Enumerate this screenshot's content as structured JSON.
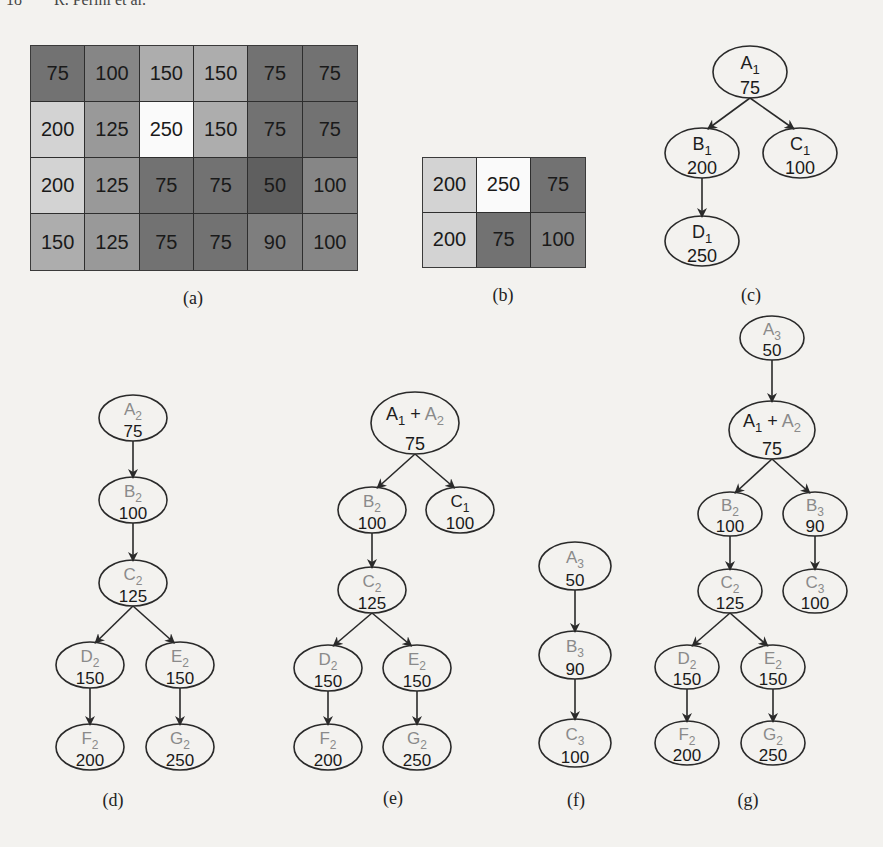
{
  "page": {
    "running_head": "18        R. Perini et al."
  },
  "colors": {
    "node_stroke": "#2a2a2a",
    "label_set1": "#1e1e1e",
    "label_set2": "#8a8a8a",
    "label_set3": "#8a8a8a",
    "value_text": "#1a1a1a"
  },
  "grid_a": {
    "caption": "(a)",
    "rows": [
      [
        75,
        100,
        150,
        "150",
        75,
        75
      ],
      [
        200,
        125,
        250,
        150,
        75,
        75
      ],
      [
        200,
        125,
        75,
        75,
        50,
        100
      ],
      [
        150,
        125,
        75,
        75,
        90,
        100
      ]
    ]
  },
  "grid_b": {
    "caption": "(b)",
    "rows": [
      [
        200,
        250,
        75
      ],
      [
        200,
        75,
        100
      ]
    ]
  },
  "trees": [
    {
      "id": "c",
      "caption": "(c)",
      "nodes": [
        {
          "id": "A1",
          "letter": "A",
          "sub": "1",
          "set": 1,
          "value": "75",
          "x": 750,
          "y": 72,
          "rx": 37,
          "ry": 26
        },
        {
          "id": "B1",
          "letter": "B",
          "sub": "1",
          "set": 1,
          "value": "200",
          "x": 702,
          "y": 153,
          "rx": 37,
          "ry": 25
        },
        {
          "id": "C1",
          "letter": "C",
          "sub": "1",
          "set": 1,
          "value": "100",
          "x": 800,
          "y": 153,
          "rx": 37,
          "ry": 25
        },
        {
          "id": "D1",
          "letter": "D",
          "sub": "1",
          "set": 1,
          "value": "250",
          "x": 702,
          "y": 241,
          "rx": 37,
          "ry": 25
        }
      ],
      "edges": [
        [
          "A1",
          "B1"
        ],
        [
          "A1",
          "C1"
        ],
        [
          "B1",
          "D1"
        ]
      ]
    },
    {
      "id": "d",
      "caption": "(d)",
      "nodes": [
        {
          "id": "A2",
          "letter": "A",
          "sub": "2",
          "set": 2,
          "value": "75",
          "x": 133,
          "y": 418,
          "rx": 34,
          "ry": 23
        },
        {
          "id": "B2",
          "letter": "B",
          "sub": "2",
          "set": 2,
          "value": "100",
          "x": 133,
          "y": 500,
          "rx": 34,
          "ry": 23
        },
        {
          "id": "C2",
          "letter": "C",
          "sub": "2",
          "set": 2,
          "value": "125",
          "x": 133,
          "y": 583,
          "rx": 34,
          "ry": 23
        },
        {
          "id": "D2",
          "letter": "D",
          "sub": "2",
          "set": 2,
          "value": "150",
          "x": 90,
          "y": 665,
          "rx": 34,
          "ry": 23
        },
        {
          "id": "E2",
          "letter": "E",
          "sub": "2",
          "set": 2,
          "value": "150",
          "x": 180,
          "y": 665,
          "rx": 34,
          "ry": 23
        },
        {
          "id": "F2",
          "letter": "F",
          "sub": "2",
          "set": 2,
          "value": "200",
          "x": 90,
          "y": 747,
          "rx": 34,
          "ry": 23
        },
        {
          "id": "G2",
          "letter": "G",
          "sub": "2",
          "set": 2,
          "value": "250",
          "x": 180,
          "y": 747,
          "rx": 34,
          "ry": 23
        }
      ],
      "edges": [
        [
          "A2",
          "B2"
        ],
        [
          "B2",
          "C2"
        ],
        [
          "C2",
          "D2"
        ],
        [
          "C2",
          "E2"
        ],
        [
          "D2",
          "F2"
        ],
        [
          "E2",
          "G2"
        ]
      ]
    },
    {
      "id": "e",
      "caption": "(e)",
      "nodes": [
        {
          "id": "A12",
          "letter": "A",
          "sub": "1",
          "set": 1,
          "plus_letter": "A",
          "plus_sub": "2",
          "plus_set": 2,
          "value": "75",
          "x": 415,
          "y": 423,
          "rx": 44,
          "ry": 31
        },
        {
          "id": "B2",
          "letter": "B",
          "sub": "2",
          "set": 2,
          "value": "100",
          "x": 372,
          "y": 510,
          "rx": 34,
          "ry": 23
        },
        {
          "id": "C1",
          "letter": "C",
          "sub": "1",
          "set": 1,
          "value": "100",
          "x": 460,
          "y": 510,
          "rx": 34,
          "ry": 23
        },
        {
          "id": "C2",
          "letter": "C",
          "sub": "2",
          "set": 2,
          "value": "125",
          "x": 372,
          "y": 590,
          "rx": 34,
          "ry": 23
        },
        {
          "id": "D2",
          "letter": "D",
          "sub": "2",
          "set": 2,
          "value": "150",
          "x": 328,
          "y": 668,
          "rx": 34,
          "ry": 23
        },
        {
          "id": "E2",
          "letter": "E",
          "sub": "2",
          "set": 2,
          "value": "150",
          "x": 417,
          "y": 668,
          "rx": 34,
          "ry": 23
        },
        {
          "id": "F2",
          "letter": "F",
          "sub": "2",
          "set": 2,
          "value": "200",
          "x": 328,
          "y": 747,
          "rx": 34,
          "ry": 23
        },
        {
          "id": "G2",
          "letter": "G",
          "sub": "2",
          "set": 2,
          "value": "250",
          "x": 417,
          "y": 747,
          "rx": 34,
          "ry": 23
        }
      ],
      "edges": [
        [
          "A12",
          "B2"
        ],
        [
          "A12",
          "C1"
        ],
        [
          "B2",
          "C2"
        ],
        [
          "C2",
          "D2"
        ],
        [
          "C2",
          "E2"
        ],
        [
          "D2",
          "F2"
        ],
        [
          "E2",
          "G2"
        ]
      ]
    },
    {
      "id": "f",
      "caption": "(f)",
      "nodes": [
        {
          "id": "A3",
          "letter": "A",
          "sub": "3",
          "set": 3,
          "value": "50",
          "x": 575,
          "y": 566,
          "rx": 36,
          "ry": 24
        },
        {
          "id": "B3",
          "letter": "B",
          "sub": "3",
          "set": 3,
          "value": "90",
          "x": 575,
          "y": 655,
          "rx": 36,
          "ry": 24
        },
        {
          "id": "C3",
          "letter": "C",
          "sub": "3",
          "set": 3,
          "value": "100",
          "x": 575,
          "y": 743,
          "rx": 36,
          "ry": 24
        }
      ],
      "edges": [
        [
          "A3",
          "B3"
        ],
        [
          "B3",
          "C3"
        ]
      ]
    },
    {
      "id": "g",
      "caption": "(g)",
      "nodes": [
        {
          "id": "A3",
          "letter": "A",
          "sub": "3",
          "set": 3,
          "value": "50",
          "x": 772,
          "y": 338,
          "rx": 32,
          "ry": 22
        },
        {
          "id": "A12",
          "letter": "A",
          "sub": "1",
          "set": 1,
          "plus_letter": "A",
          "plus_sub": "2",
          "plus_set": 2,
          "value": "75",
          "x": 772,
          "y": 430,
          "rx": 43,
          "ry": 29
        },
        {
          "id": "B2",
          "letter": "B",
          "sub": "2",
          "set": 2,
          "value": "100",
          "x": 730,
          "y": 514,
          "rx": 32,
          "ry": 22
        },
        {
          "id": "B3",
          "letter": "B",
          "sub": "3",
          "set": 3,
          "value": "90",
          "x": 815,
          "y": 514,
          "rx": 32,
          "ry": 22
        },
        {
          "id": "C2",
          "letter": "C",
          "sub": "2",
          "set": 2,
          "value": "125",
          "x": 730,
          "y": 591,
          "rx": 32,
          "ry": 22
        },
        {
          "id": "C3",
          "letter": "C",
          "sub": "3",
          "set": 3,
          "value": "100",
          "x": 815,
          "y": 591,
          "rx": 32,
          "ry": 22
        },
        {
          "id": "D2",
          "letter": "D",
          "sub": "2",
          "set": 2,
          "value": "150",
          "x": 687,
          "y": 667,
          "rx": 32,
          "ry": 22
        },
        {
          "id": "E2",
          "letter": "E",
          "sub": "2",
          "set": 2,
          "value": "150",
          "x": 773,
          "y": 667,
          "rx": 32,
          "ry": 22
        },
        {
          "id": "F2",
          "letter": "F",
          "sub": "2",
          "set": 2,
          "value": "200",
          "x": 687,
          "y": 743,
          "rx": 32,
          "ry": 22
        },
        {
          "id": "G2",
          "letter": "G",
          "sub": "2",
          "set": 2,
          "value": "250",
          "x": 773,
          "y": 743,
          "rx": 32,
          "ry": 22
        }
      ],
      "edges": [
        [
          "A3",
          "A12"
        ],
        [
          "A12",
          "B2"
        ],
        [
          "A12",
          "B3"
        ],
        [
          "B2",
          "C2"
        ],
        [
          "B3",
          "C3"
        ],
        [
          "C2",
          "D2"
        ],
        [
          "C2",
          "E2"
        ],
        [
          "D2",
          "F2"
        ],
        [
          "E2",
          "G2"
        ]
      ]
    }
  ],
  "captions": {
    "a": {
      "text": "(a)",
      "x": 193,
      "y": 288
    },
    "b": {
      "text": "(b)",
      "x": 503,
      "y": 285
    },
    "c": {
      "text": "(c)",
      "x": 751,
      "y": 285
    },
    "d": {
      "text": "(d)",
      "x": 113,
      "y": 790
    },
    "e": {
      "text": "(e)",
      "x": 393,
      "y": 788
    },
    "f": {
      "text": "(f)",
      "x": 576,
      "y": 790
    },
    "g": {
      "text": "(g)",
      "x": 748,
      "y": 790
    }
  }
}
